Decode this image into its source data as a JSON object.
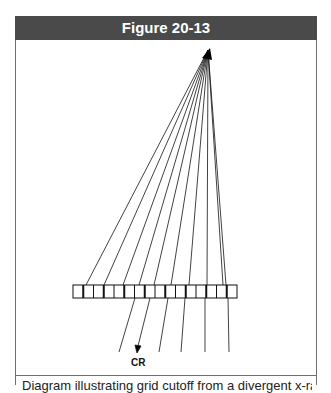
{
  "figure": {
    "title": "Figure 20-13",
    "caption": "Diagram illustrating grid cutoff from a divergent x-ray beam"
  },
  "diagram": {
    "focal_point": {
      "x": 208,
      "y": 50
    },
    "grid": {
      "x": 73,
      "y": 285,
      "width": 164,
      "height": 13,
      "strips": 16
    },
    "rays_above_grid_end_x": [
      86,
      104,
      123,
      139,
      154,
      171,
      189,
      207,
      223,
      226
    ],
    "rays_below_grid": [
      {
        "x1": 135,
        "x2": 119
      },
      {
        "x1": 150,
        "x2": 138,
        "arrow": true
      },
      {
        "x1": 168,
        "x2": 159
      },
      {
        "x1": 185,
        "x2": 181
      },
      {
        "x1": 205,
        "x2": 205
      },
      {
        "x1": 228,
        "x2": 229
      }
    ],
    "central_ray_label": "CR"
  }
}
